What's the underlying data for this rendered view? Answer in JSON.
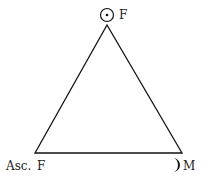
{
  "diagram": {
    "type": "astrological-triangle",
    "vertices": [
      {
        "id": "top",
        "symbol": "☉",
        "symbol_name": "sun",
        "label": "F",
        "x": 107,
        "y": 25
      },
      {
        "id": "bottom-left",
        "symbol": "Asc.",
        "symbol_name": "ascendant",
        "label": "F",
        "x": 35,
        "y": 153
      },
      {
        "id": "bottom-right",
        "symbol": "☽",
        "symbol_name": "moon",
        "label": "M",
        "x": 182,
        "y": 153
      }
    ],
    "top_label": "F",
    "left_prefix": "Asc.",
    "left_label": "F",
    "right_label": "M",
    "line_color": "#111111"
  }
}
